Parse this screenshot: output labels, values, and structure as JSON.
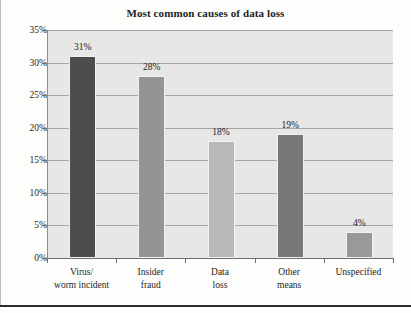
{
  "chart_data": {
    "type": "bar",
    "title": "Most common causes of data loss",
    "xlabel": "",
    "ylabel": "",
    "categories": [
      "Virus/\nworm incident",
      "Insider\nfraud",
      "Data\nloss",
      "Other\nmeans",
      "Unspecified"
    ],
    "category_lines": [
      [
        "Virus/",
        "worm incident"
      ],
      [
        "Insider",
        "fraud"
      ],
      [
        "Data",
        "loss"
      ],
      [
        "Other",
        "means"
      ],
      [
        "Unspecified",
        ""
      ]
    ],
    "values": [
      31,
      28,
      18,
      19,
      4
    ],
    "value_labels": [
      "31%",
      "28%",
      "18%",
      "19%",
      "4%"
    ],
    "bar_colors": [
      "#4d4d4d",
      "#949493",
      "#b9b9b7",
      "#777775",
      "#999998"
    ],
    "ylim": [
      0,
      35
    ],
    "ytick_values": [
      0,
      5,
      10,
      15,
      20,
      25,
      30,
      35
    ],
    "ytick_labels": [
      "0%",
      "5%",
      "10%",
      "15%",
      "20%",
      "25%",
      "30%",
      "35%"
    ],
    "grid": true,
    "legend": null,
    "plot_background": "#e7e7e6",
    "gridline_color": "#a5a5a4",
    "text_color": "#1d1d1d"
  }
}
